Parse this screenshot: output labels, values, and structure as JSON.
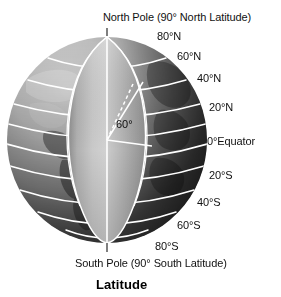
{
  "figure": {
    "caption": "Latitude"
  },
  "poles": {
    "north_label": "North Pole (90° North Latitude)",
    "south_label": "South Pole (90° South Latitude)"
  },
  "angle_annotation": {
    "label": "60°"
  },
  "latitude_labels": [
    {
      "id": "n80",
      "text": "80°N",
      "degrees": 80,
      "hemisphere": "N"
    },
    {
      "id": "n60",
      "text": "60°N",
      "degrees": 60,
      "hemisphere": "N"
    },
    {
      "id": "n40",
      "text": "40°N",
      "degrees": 40,
      "hemisphere": "N"
    },
    {
      "id": "n20",
      "text": "20°N",
      "degrees": 20,
      "hemisphere": "N"
    },
    {
      "id": "eq",
      "text": "0°Equator",
      "degrees": 0,
      "hemisphere": ""
    },
    {
      "id": "s20",
      "text": "20°S",
      "degrees": -20,
      "hemisphere": "S"
    },
    {
      "id": "s40",
      "text": "40°S",
      "degrees": -40,
      "hemisphere": "S"
    },
    {
      "id": "s60",
      "text": "60°S",
      "degrees": -60,
      "hemisphere": "S"
    },
    {
      "id": "s80",
      "text": "80°S",
      "degrees": -80,
      "hemisphere": "S"
    }
  ],
  "colors": {
    "globe_light": "#b9b9b9",
    "globe_dark": "#3b3b3b",
    "wedge_face": "#aaaaaa",
    "wedge_face_light": "#c6c6c6",
    "grid_line": "#ffffff",
    "text": "#111111",
    "background": "#ffffff"
  }
}
